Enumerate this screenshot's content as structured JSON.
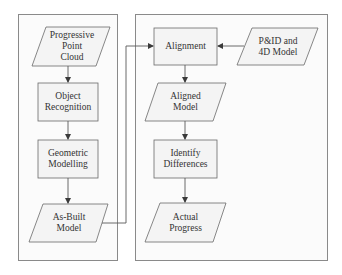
{
  "diagram": {
    "type": "flowchart",
    "colors": {
      "stroke": "#6a6a6a",
      "box_fill": "#f4f4f4",
      "panel_border": "#8a8a8a",
      "text": "#333333"
    },
    "left_panel": {
      "nodes": [
        {
          "id": "progressive-point-cloud",
          "shape": "parallelogram",
          "label": "Progressive\nPoint\nCloud"
        },
        {
          "id": "object-recognition",
          "shape": "process",
          "label": "Object\nRecognition"
        },
        {
          "id": "geometric-modelling",
          "shape": "process",
          "label": "Geometric\nModelling"
        },
        {
          "id": "as-built-model",
          "shape": "parallelogram",
          "label": "As-Built\nModel"
        }
      ]
    },
    "right_panel": {
      "nodes": [
        {
          "id": "alignment",
          "shape": "process",
          "label": "Alignment"
        },
        {
          "id": "pid-4d-model",
          "shape": "parallelogram",
          "label": "P&ID and\n4D Model"
        },
        {
          "id": "aligned-model",
          "shape": "parallelogram",
          "label": "Aligned\nModel"
        },
        {
          "id": "identify-differences",
          "shape": "process",
          "label": "Identify\nDifferences"
        },
        {
          "id": "actual-progress",
          "shape": "parallelogram",
          "label": "Actual\nProgress"
        }
      ]
    },
    "edges": [
      {
        "from": "progressive-point-cloud",
        "to": "object-recognition"
      },
      {
        "from": "object-recognition",
        "to": "geometric-modelling"
      },
      {
        "from": "geometric-modelling",
        "to": "as-built-model"
      },
      {
        "from": "as-built-model",
        "to": "alignment"
      },
      {
        "from": "pid-4d-model",
        "to": "alignment"
      },
      {
        "from": "alignment",
        "to": "aligned-model"
      },
      {
        "from": "aligned-model",
        "to": "identify-differences"
      },
      {
        "from": "identify-differences",
        "to": "actual-progress"
      }
    ]
  }
}
